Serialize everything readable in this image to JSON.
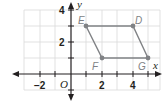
{
  "figure": {
    "type": "coordinate-plane",
    "axes": {
      "x_label": "x",
      "y_label": "y",
      "origin_label": "O",
      "x_ticks": [
        {
          "value": -2,
          "label": "−2"
        },
        {
          "value": 2,
          "label": "2"
        },
        {
          "value": 4,
          "label": "4"
        }
      ],
      "y_ticks": [
        {
          "value": 2,
          "label": "2"
        },
        {
          "value": 4,
          "label": "4"
        }
      ],
      "x_range": [
        -3,
        5
      ],
      "y_range": [
        -1,
        4
      ]
    },
    "points": [
      {
        "name": "E",
        "x": 1,
        "y": 3
      },
      {
        "name": "D",
        "x": 4,
        "y": 3
      },
      {
        "name": "G",
        "x": 5,
        "y": 1
      },
      {
        "name": "F",
        "x": 2,
        "y": 1
      }
    ],
    "polygon": [
      "E",
      "D",
      "G",
      "F"
    ],
    "colors": {
      "grid": "#d9d9d9",
      "axis": "#231f20",
      "shape": "#808285",
      "point": "#808285"
    }
  }
}
